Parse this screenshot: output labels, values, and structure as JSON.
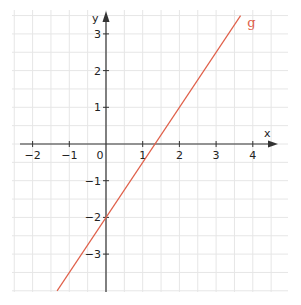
{
  "chart_data": {
    "type": "line",
    "title": "",
    "xlabel": "x",
    "ylabel": "y",
    "xlim": [
      -2.55,
      4.95
    ],
    "ylim": [
      -4.0,
      3.7
    ],
    "grid": true,
    "grid_step": 0.5,
    "x_ticks": [
      -2,
      -1,
      0,
      1,
      2,
      3,
      4
    ],
    "x_tick_labels": [
      "−2",
      "−1",
      "0",
      "1",
      "2",
      "3",
      "4"
    ],
    "y_ticks": [
      -3,
      -2,
      -1,
      1,
      2,
      3
    ],
    "y_tick_labels": [
      "−3",
      "−2",
      "−1",
      "1",
      "2",
      "3"
    ],
    "series": [
      {
        "name": "g",
        "function": "y = 1.5x - 2",
        "slope": 1.5,
        "intercept": -2,
        "x": [
          -1.333,
          3.667
        ],
        "y": [
          -4.0,
          3.5
        ],
        "color": "#e0604a"
      }
    ],
    "annotations": [
      {
        "text": "g",
        "x": 3.85,
        "y": 3.2,
        "color": "#e0604a"
      }
    ],
    "legend": "none"
  },
  "colors": {
    "grid": "#e6e6e6",
    "axis": "#333333",
    "line": "#e0604a",
    "background": "#ffffff"
  }
}
